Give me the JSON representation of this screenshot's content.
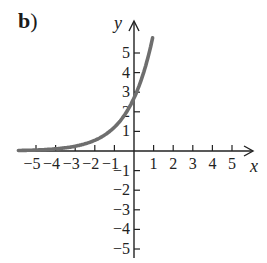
{
  "panel_label": {
    "letter": "b",
    "paren": ")"
  },
  "axes": {
    "x_label": "x",
    "y_label": "y",
    "x_ticks": [
      "−5",
      "−4",
      "−3",
      "−2",
      "−1",
      "1",
      "2",
      "3",
      "4",
      "5"
    ],
    "y_ticks": [
      "5",
      "4",
      "3",
      "2",
      "1",
      "−1",
      "−2",
      "−3",
      "−4",
      "−5"
    ]
  },
  "colors": {
    "axis": "#222222",
    "curve": "#6e6e6e"
  },
  "chart_data": {
    "type": "line",
    "title": "b)",
    "xlabel": "x",
    "ylabel": "y",
    "xlim": [
      -5.8,
      6
    ],
    "ylim": [
      -5.5,
      6
    ],
    "grid": false,
    "series": [
      {
        "name": "exponential curve",
        "x": [
          -6,
          -5,
          -4,
          -3,
          -2,
          -1,
          0,
          0.5,
          1
        ],
        "y": [
          0.02,
          0.05,
          0.11,
          0.24,
          0.54,
          1.2,
          2.7,
          4.0,
          6.0
        ]
      }
    ],
    "x_ticks": [
      -5,
      -4,
      -3,
      -2,
      -1,
      1,
      2,
      3,
      4,
      5
    ],
    "y_ticks": [
      -5,
      -4,
      -3,
      -2,
      -1,
      1,
      2,
      3,
      4,
      5
    ],
    "asymptote": "y = 0 (horizontal, as x → −∞)",
    "y_intercept_approx": 2.7
  }
}
